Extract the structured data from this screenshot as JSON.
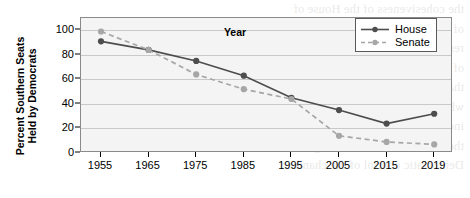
{
  "chart_data": {
    "type": "line",
    "title": "",
    "xlabel": "Year",
    "ylabel": "Percent Southern Seats Held by Democrats",
    "ylabel_line1": "Percent Southern Seats",
    "ylabel_line2": "Held by Democrats",
    "categories": [
      1955,
      1965,
      1975,
      1985,
      1995,
      2005,
      2015,
      2019
    ],
    "xtick_labels": [
      "1955",
      "1965",
      "1975",
      "1985",
      "1995",
      "2005",
      "2015",
      "2019"
    ],
    "ytick_labels": [
      "0",
      "20",
      "40",
      "60",
      "80",
      "100"
    ],
    "ytick_values": [
      0,
      20,
      40,
      60,
      80,
      100
    ],
    "ylim": [
      0,
      110
    ],
    "xlim": [
      1950,
      2024
    ],
    "grid": "horizontal",
    "legend_position": "top-right",
    "series": [
      {
        "name": "House",
        "color": "#4d4d4d",
        "linestyle": "solid",
        "marker": "circle",
        "values": [
          91,
          84,
          75,
          63,
          45,
          35,
          24,
          32
        ]
      },
      {
        "name": "Senate",
        "color": "#a6a6a6",
        "linestyle": "dashed",
        "marker": "circle",
        "values": [
          99,
          84,
          64,
          52,
          44,
          14,
          9,
          7
        ]
      }
    ]
  },
  "legend": {
    "items": [
      {
        "label": "House"
      },
      {
        "label": "Senate"
      }
    ]
  },
  "colors": {
    "house": "#4d4d4d",
    "senate": "#a6a6a6",
    "plot_background": "#f4f4f4",
    "gridline": "#c9c9c9",
    "axis": "#000000"
  },
  "watermark": {
    "lines": [
      "the cohesiveness of the House of",
      "of Republicans, and their policy",
      "resort to seniority rules that had",
      "of the House has a growing number",
      "that the Senate was more liberal than",
      "while Republicans came to senior ingly",
      "increasingly dominated during the post-civil",
      "the effects of the rules changes in the",
      "Democratic control of the chamber"
    ]
  }
}
